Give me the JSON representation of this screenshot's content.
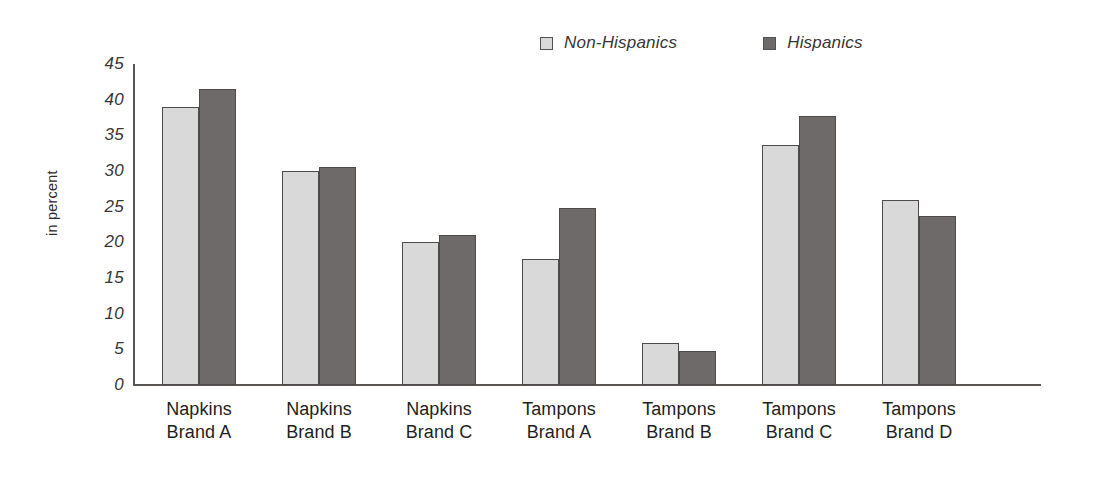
{
  "chart_data": {
    "type": "bar",
    "title": "",
    "xlabel": "",
    "ylabel": "in percent",
    "ylim": [
      0,
      45
    ],
    "yticks": [
      45,
      40,
      35,
      30,
      25,
      20,
      15,
      10,
      5,
      0
    ],
    "grid": false,
    "legend_position": "top",
    "categories": [
      "Napkins\nBrand A",
      "Napkins\nBrand B",
      "Napkins\nBrand C",
      "Tampons\nBrand A",
      "Tampons\nBrand B",
      "Tampons\nBrand C",
      "Tampons\nBrand D"
    ],
    "category_lines": [
      [
        "Napkins",
        "Brand A"
      ],
      [
        "Napkins",
        "Brand B"
      ],
      [
        "Napkins",
        "Brand C"
      ],
      [
        "Tampons",
        "Brand A"
      ],
      [
        "Tampons",
        "Brand B"
      ],
      [
        "Tampons",
        "Brand C"
      ],
      [
        "Tampons",
        "Brand D"
      ]
    ],
    "series": [
      {
        "name": "Non-Hispanics",
        "color": "#d9d9d9",
        "values": [
          39.0,
          30.0,
          20.0,
          17.6,
          5.9,
          33.6,
          26.0
        ]
      },
      {
        "name": "Hispanics",
        "color": "#6d6a69",
        "values": [
          41.5,
          30.6,
          21.0,
          24.8,
          4.7,
          37.7,
          23.7
        ]
      }
    ]
  },
  "legend": {
    "items": [
      {
        "label": "Non-Hispanics",
        "swatch": "light-gray-swatch"
      },
      {
        "label": "Hispanics",
        "swatch": "dark-gray-swatch"
      }
    ]
  },
  "axis": {
    "y_title": "in percent"
  }
}
